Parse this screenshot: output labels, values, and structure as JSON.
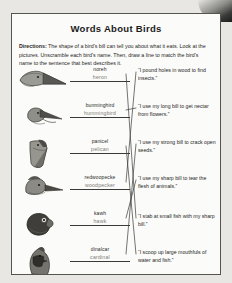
{
  "worksheet": {
    "title": "Words About Birds",
    "directions_label": "Directions:",
    "directions_text": " The shape of a bird's bill can tell you about what it eats. Look at the pictures. Unscramble each bird's name. Then, draw a line to match the bird's name to the sentence that best describes it."
  },
  "birds": [
    {
      "icon": "heron-head-icon",
      "scrambled": "noreh",
      "answer": "heron",
      "row_top": 4
    },
    {
      "icon": "hummingbird-head-icon",
      "scrambled": "bunminghird",
      "answer": "hummingbird",
      "row_top": 40
    },
    {
      "icon": "pelican-head-icon",
      "scrambled": "panicel",
      "answer": "pelican",
      "row_top": 76
    },
    {
      "icon": "woodpecker-head-icon",
      "scrambled": "redwoopecke",
      "answer": "woodpecker",
      "row_top": 112
    },
    {
      "icon": "hawk-head-icon",
      "scrambled": "kawh",
      "answer": "hawk",
      "row_top": 148
    },
    {
      "icon": "cardinal-head-icon",
      "scrambled": "dinalcar",
      "answer": "cardinal",
      "row_top": 184
    }
  ],
  "clues": [
    {
      "text": "“I pound holes in wood to find insects.”",
      "top": 6
    },
    {
      "text": "“I use my long bill to get nectar from flowers.”",
      "top": 42
    },
    {
      "text": "“I use my strong bill to crack open seeds.”",
      "top": 78
    },
    {
      "text": "“I use my sharp bill to tear the flesh of animals.”",
      "top": 114
    },
    {
      "text": "“I stab at small fish with my sharp bill.”",
      "top": 152
    },
    {
      "text": "“I scoop up large mouthfuls of water and fish.”",
      "top": 188
    }
  ],
  "match_lines": [
    {
      "from": "heron",
      "to": "stab-fish",
      "x1": 114,
      "y1": 14,
      "x2": 124,
      "y2": 158
    },
    {
      "from": "hummingbird",
      "to": "nectar",
      "x1": 114,
      "y1": 50,
      "x2": 124,
      "y2": 48
    },
    {
      "from": "pelican",
      "to": "scoop-water",
      "x1": 114,
      "y1": 86,
      "x2": 124,
      "y2": 194
    },
    {
      "from": "woodpecker",
      "to": "pound-holes",
      "x1": 114,
      "y1": 122,
      "x2": 124,
      "y2": 12
    },
    {
      "from": "hawk",
      "to": "tear-flesh",
      "x1": 114,
      "y1": 158,
      "x2": 124,
      "y2": 120
    },
    {
      "from": "cardinal",
      "to": "crack-seeds",
      "x1": 114,
      "y1": 194,
      "x2": 124,
      "y2": 84
    }
  ],
  "colors": {
    "paper": "#fbfbf9",
    "ink": "#1f1f1f",
    "line": "#3a3a38",
    "answer_text": "#7c7b78",
    "page_bg": "#e8e7e3"
  }
}
